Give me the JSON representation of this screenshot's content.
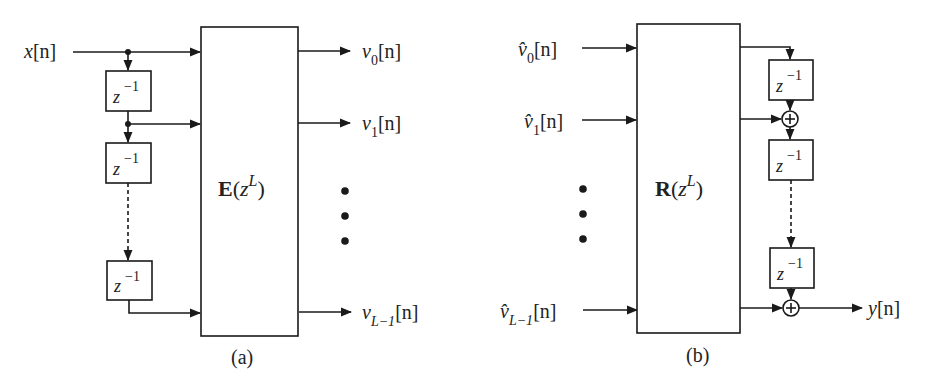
{
  "figure": {
    "panel_a": {
      "caption": "(a)",
      "input_label": {
        "var": "x",
        "arg": "[n]"
      },
      "delay_label": {
        "base": "z",
        "exp": "−1"
      },
      "block_label": {
        "name": "E",
        "open": "(",
        "var": "z",
        "exp": "L",
        "close": ")"
      },
      "outputs": [
        {
          "var": "v",
          "sub": "0",
          "arg": "[n]"
        },
        {
          "var": "v",
          "sub": "1",
          "arg": "[n]"
        },
        {
          "var": "v",
          "sub": "L−1",
          "arg": "[n]"
        }
      ]
    },
    "panel_b": {
      "caption": "(b)",
      "inputs": [
        {
          "var": "v̂",
          "sub": "0",
          "arg": "[n]"
        },
        {
          "var": "v̂",
          "sub": "1",
          "arg": "[n]"
        },
        {
          "var": "v̂",
          "sub": "L−1",
          "arg": "[n]"
        }
      ],
      "delay_label": {
        "base": "z",
        "exp": "−1"
      },
      "block_label": {
        "name": "R",
        "open": "(",
        "var": "z",
        "exp": "L",
        "close": ")"
      },
      "adder_symbol": "+",
      "output_label": {
        "var": "y",
        "arg": "[n]"
      }
    },
    "colors": {
      "stroke": "#1a1a1a",
      "text": "#222222",
      "background": "#ffffff"
    }
  }
}
